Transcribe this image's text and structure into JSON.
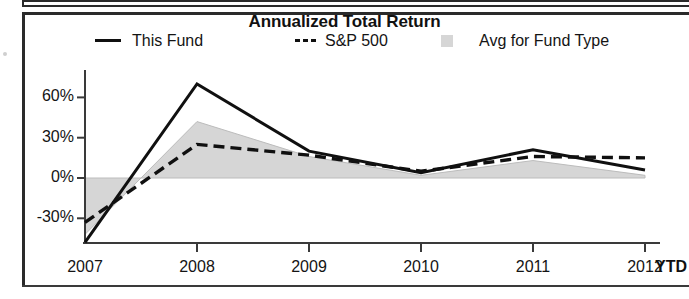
{
  "chart_data": {
    "type": "line",
    "title": "Annualized Total Return",
    "xlabel": "",
    "ylabel": "",
    "categories": [
      "2007",
      "2008",
      "2009",
      "2010",
      "2011",
      "2012"
    ],
    "x_axis_note": "YTD",
    "ytick_labels": [
      "60%",
      "30%",
      "0%",
      "-30%"
    ],
    "ytick_values": [
      60,
      30,
      0,
      -30
    ],
    "ylim": [
      -48,
      78
    ],
    "grid": false,
    "legend_position": "top",
    "series": [
      {
        "name": "This Fund",
        "style": "solid",
        "color": "#101010",
        "values": [
          -48,
          70,
          20,
          4,
          21,
          6
        ]
      },
      {
        "name": "S&P 500",
        "style": "dashed",
        "color": "#101010",
        "values": [
          -33,
          25,
          17,
          5,
          16,
          15
        ]
      },
      {
        "name": "Avg for Fund Type",
        "style": "area",
        "color": "#d6d6d6",
        "values": [
          -42,
          42,
          16,
          2,
          13,
          2
        ]
      }
    ]
  },
  "chart": {
    "title": "Annualized Total Return",
    "legend": [
      {
        "label": "This Fund",
        "marker": "solid-line"
      },
      {
        "label": "S&P 500",
        "marker": "dashed-line"
      },
      {
        "label": "Avg for Fund Type",
        "marker": "gray-square"
      }
    ],
    "axis": {
      "y_ticks": [
        "60%",
        "30%",
        "0%",
        "-30%"
      ],
      "x_ticks": [
        "2007",
        "2008",
        "2009",
        "2010",
        "2011",
        "2012"
      ],
      "x_suffix": "YTD"
    },
    "colors": {
      "line": "#101010",
      "area_fill": "#d6d6d6",
      "axis": "#3a3a3a",
      "frame": "#2a2a2a"
    }
  }
}
